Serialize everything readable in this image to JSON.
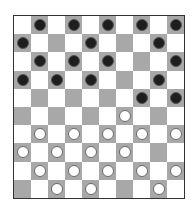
{
  "game": "checkers",
  "board": {
    "size": 10,
    "colors": {
      "light": "#ffffff",
      "dark": "#a8a8a8",
      "black_piece": "#1e1e1e",
      "white_piece": "#ffffff"
    },
    "rows": [
      ".b.b.b.b.b",
      "b...b...b.",
      ".b.b.b...b",
      "b.b.b...b.",
      ".......b.b",
      "......w...",
      ".w.w.w.w.w",
      "w.w.w.w...",
      ".w.w.w.w.w",
      "..w.w...w."
    ]
  },
  "counts": {
    "black": 17,
    "white": 19
  }
}
